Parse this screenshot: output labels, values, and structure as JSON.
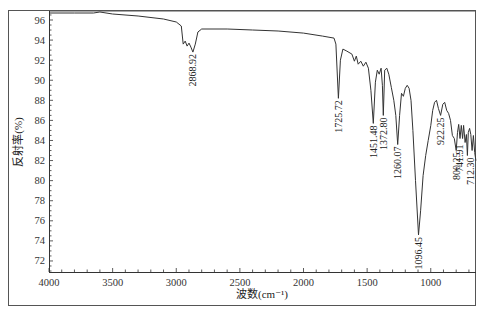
{
  "chart_data": {
    "type": "line",
    "title": "",
    "xlabel": "波数(cm⁻¹)",
    "ylabel": "反射率(%)",
    "xlim": [
      4000,
      640
    ],
    "ylim": [
      71,
      96.9
    ],
    "x_reversed": true,
    "grid": false,
    "legend": null,
    "x_ticks": [
      4000,
      3500,
      3000,
      2500,
      2000,
      1500,
      1000
    ],
    "y_ticks": [
      72,
      74,
      76,
      78,
      80,
      82,
      84,
      86,
      88,
      90,
      92,
      94,
      96
    ],
    "series": [
      {
        "name": "IR spectrum",
        "color": "#333333",
        "x": [
          4000,
          3800,
          3650,
          3600,
          3500,
          3300,
          3100,
          3000,
          2960,
          2945,
          2930,
          2915,
          2900,
          2885,
          2868.92,
          2850,
          2830,
          2800,
          2600,
          2400,
          2200,
          2000,
          1850,
          1760,
          1745,
          1725.72,
          1710,
          1690,
          1660,
          1620,
          1600,
          1585,
          1570,
          1550,
          1530,
          1510,
          1490,
          1470,
          1451.48,
          1435,
          1420,
          1405,
          1390,
          1380,
          1372.8,
          1362,
          1345,
          1330,
          1310,
          1290,
          1275,
          1260.07,
          1245,
          1230,
          1215,
          1200,
          1185,
          1170,
          1155,
          1140,
          1120,
          1096.45,
          1080,
          1060,
          1040,
          1020,
          1000,
          985,
          970,
          955,
          940,
          922.25,
          905,
          890,
          875,
          860,
          845,
          830,
          815,
          800.25,
          790,
          780,
          770,
          760,
          750,
          741.91,
          730,
          720,
          712.3,
          705,
          695,
          685,
          675,
          665,
          655,
          645
        ],
        "values": [
          96.7,
          96.7,
          96.7,
          96.8,
          96.6,
          96.4,
          96.1,
          95.8,
          95.4,
          93.6,
          93.9,
          93.4,
          93.7,
          93.3,
          92.8,
          93.6,
          94.8,
          95.1,
          95.1,
          95.0,
          94.9,
          94.7,
          94.4,
          94.2,
          93.6,
          88.2,
          92.0,
          93.1,
          92.9,
          92.6,
          91.9,
          92.4,
          91.6,
          91.9,
          91.4,
          91.8,
          91.2,
          89.0,
          85.7,
          89.8,
          91.0,
          90.6,
          91.2,
          89.5,
          86.5,
          91.0,
          91.2,
          90.6,
          89.3,
          88.0,
          86.5,
          83.6,
          86.5,
          88.7,
          88.4,
          89.2,
          89.5,
          89.2,
          88.0,
          85.0,
          80.0,
          74.6,
          77.0,
          80.5,
          82.5,
          84.0,
          85.5,
          87.0,
          87.8,
          88.0,
          87.2,
          86.5,
          87.6,
          87.8,
          87.0,
          86.7,
          86.0,
          84.5,
          84.2,
          83.0,
          84.8,
          85.6,
          84.2,
          85.5,
          84.2,
          85.5,
          83.8,
          84.6,
          82.5,
          84.8,
          85.2,
          84.6,
          83.0,
          84.5,
          82.8,
          82.0
        ]
      }
    ],
    "annotations": [
      {
        "text": "2868.92",
        "x": 2868.92,
        "y": 92.8
      },
      {
        "text": "1725.72",
        "x": 1725.72,
        "y": 88.2
      },
      {
        "text": "1451.48",
        "x": 1451.48,
        "y": 85.7
      },
      {
        "text": "1372.80",
        "x": 1372.8,
        "y": 86.5
      },
      {
        "text": "1260.07",
        "x": 1260.07,
        "y": 83.6
      },
      {
        "text": "1096.45",
        "x": 1096.45,
        "y": 74.6
      },
      {
        "text": "922.25",
        "x": 922.25,
        "y": 86.5
      },
      {
        "text": "800.25",
        "x": 800.25,
        "y": 83.0
      },
      {
        "text": "741.91",
        "x": 741.91,
        "y": 83.8
      },
      {
        "text": "712.30",
        "x": 712.3,
        "y": 82.5
      }
    ]
  },
  "labels": {
    "xlabel": "波数(cm⁻¹)",
    "ylabel": "反射率(%)"
  }
}
